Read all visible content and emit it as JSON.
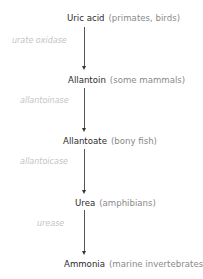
{
  "diagram": {
    "title": "",
    "type": "pathway",
    "steps": [
      {
        "compound": "Uric acid",
        "organisms": "(primates, birds)"
      },
      {
        "compound": "Allantoin",
        "organisms": "(some mammals)"
      },
      {
        "compound": "Allantoate",
        "organisms": "(bony fish)"
      },
      {
        "compound": "Urea",
        "organisms": "(amphibians)"
      },
      {
        "compound": "Ammonia",
        "organisms": "(marine invertebrates)"
      }
    ],
    "enzymes": [
      {
        "label": "urate oxidase"
      },
      {
        "label": "allantoinase"
      },
      {
        "label": "allantoicase"
      },
      {
        "label": "urease"
      }
    ],
    "colors": {
      "compound_text": "#2b2b2b",
      "organism_text": "#8a8a8a",
      "enzyme_text": "#c4c4c4",
      "arrow": "#555555"
    }
  }
}
